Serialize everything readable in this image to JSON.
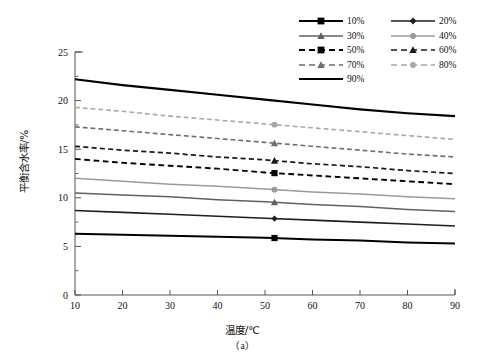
{
  "chart_data": {
    "type": "line",
    "title": "",
    "subcaption": "（a）",
    "xlabel": "温度/℃",
    "ylabel": "平衡含水率/%",
    "xlim": [
      10,
      90
    ],
    "ylim": [
      0,
      25
    ],
    "xticks": [
      10,
      20,
      30,
      40,
      50,
      60,
      70,
      80,
      90
    ],
    "yticks": [
      0,
      5,
      10,
      15,
      20,
      25
    ],
    "y_minor_ticks": [
      2.5,
      7.5,
      12.5,
      17.5,
      22.5
    ],
    "grid": false,
    "legend_position": "top-right",
    "marker_x": 52,
    "x": [
      10,
      20,
      30,
      40,
      50,
      60,
      70,
      80,
      90
    ],
    "series": [
      {
        "name": "10%",
        "label": "10%",
        "values": [
          6.3,
          6.2,
          6.1,
          6.0,
          5.9,
          5.7,
          5.6,
          5.4,
          5.3
        ],
        "color": "#000000",
        "dash": "none",
        "width": 2.0,
        "marker": "square"
      },
      {
        "name": "20%",
        "label": "20%",
        "values": [
          8.7,
          8.5,
          8.3,
          8.1,
          7.9,
          7.7,
          7.5,
          7.3,
          7.1
        ],
        "color": "#1f1f1f",
        "dash": "none",
        "width": 1.6,
        "marker": "diamond"
      },
      {
        "name": "30%",
        "label": "30%",
        "values": [
          10.5,
          10.3,
          10.1,
          9.8,
          9.6,
          9.3,
          9.1,
          8.8,
          8.6
        ],
        "color": "#606060",
        "dash": "none",
        "width": 1.5,
        "marker": "triangle"
      },
      {
        "name": "40%",
        "label": "40%",
        "values": [
          12.0,
          11.7,
          11.4,
          11.2,
          10.9,
          10.6,
          10.4,
          10.1,
          9.9
        ],
        "color": "#9a9a9a",
        "dash": "none",
        "width": 1.5,
        "marker": "circle"
      },
      {
        "name": "50%",
        "label": "50%",
        "values": [
          14.0,
          13.6,
          13.3,
          13.0,
          12.6,
          12.3,
          12.0,
          11.7,
          11.4
        ],
        "color": "#000000",
        "dash": "dashed",
        "width": 1.9,
        "marker": "square"
      },
      {
        "name": "60%",
        "label": "60%",
        "values": [
          15.3,
          14.9,
          14.6,
          14.2,
          13.9,
          13.5,
          13.2,
          12.8,
          12.5
        ],
        "color": "#1a1a1a",
        "dash": "dashed",
        "width": 1.7,
        "marker": "triangle"
      },
      {
        "name": "70%",
        "label": "70%",
        "values": [
          17.3,
          16.9,
          16.5,
          16.1,
          15.7,
          15.3,
          14.9,
          14.5,
          14.2
        ],
        "color": "#6e6e6e",
        "dash": "dashed",
        "width": 1.6,
        "marker": "triangle"
      },
      {
        "name": "80%",
        "label": "80%",
        "values": [
          19.3,
          18.9,
          18.4,
          18.0,
          17.6,
          17.2,
          16.8,
          16.4,
          16.0
        ],
        "color": "#a8a8a8",
        "dash": "dashed",
        "width": 1.6,
        "marker": "circle"
      },
      {
        "name": "90%",
        "label": "90%",
        "values": [
          22.2,
          21.6,
          21.1,
          20.6,
          20.1,
          19.6,
          19.1,
          18.7,
          18.4
        ],
        "color": "#000000",
        "dash": "none",
        "width": 2.2,
        "marker": "none"
      }
    ]
  },
  "legend": {
    "order": [
      "10%",
      "20%",
      "30%",
      "40%",
      "50%",
      "60%",
      "70%",
      "80%",
      "90%"
    ]
  }
}
